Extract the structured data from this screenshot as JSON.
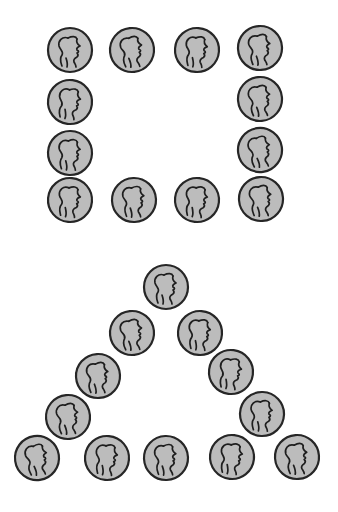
{
  "colors": {
    "background": "#ffffff",
    "coin_fill": "#bcbcbc",
    "coin_outline": "#262626"
  },
  "coin": {
    "icon": "penny-profile-icon",
    "description": "Gray coin with a profile head outline"
  },
  "figures": [
    {
      "name": "square",
      "shape": "square",
      "coin_count": 12,
      "coins_per_side": 4,
      "layout": "4 x 4 perimeter (hollow square)",
      "rows": [
        {
          "row": 1,
          "count": 4
        },
        {
          "row": 2,
          "count": 2
        },
        {
          "row": 3,
          "count": 2
        },
        {
          "row": 4,
          "count": 4
        }
      ]
    },
    {
      "name": "triangle",
      "shape": "triangle",
      "coin_count": 15,
      "coins_per_side": 5,
      "layout": "5-per-side hollow triangle",
      "rows": [
        {
          "row": 1,
          "count": 1
        },
        {
          "row": 2,
          "count": 2
        },
        {
          "row": 3,
          "count": 2
        },
        {
          "row": 4,
          "count": 2
        },
        {
          "row": 5,
          "count": 5
        }
      ]
    }
  ]
}
